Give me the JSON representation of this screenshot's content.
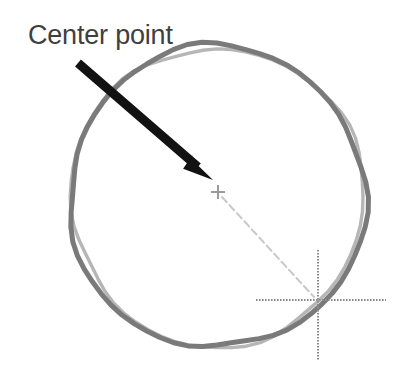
{
  "canvas": {
    "width": 397,
    "height": 381,
    "background_color": "#ffffff"
  },
  "annotation": {
    "label": "Center point",
    "label_color": "#3f3f3f",
    "label_x": 28,
    "label_y": 44,
    "font_size_px": 27
  },
  "shapes": {
    "circle": {
      "name": "hand-drawn-circle",
      "center_x": 217,
      "center_y": 197,
      "radius_x": 148,
      "radius_y": 151,
      "stroke_color": "#7a7a7a",
      "stroke_width": 5
    },
    "arrow": {
      "name": "pointer-arrow",
      "tail_x": 78,
      "tail_y": 63,
      "tip_x": 213,
      "tip_y": 180,
      "color": "#121212",
      "stroke_width": 9
    },
    "center_marker": {
      "name": "center-point-plus",
      "x": 218,
      "y": 192,
      "arm_length": 7,
      "color": "#9a9a9a",
      "stroke_width": 2
    },
    "leader_line": {
      "name": "dotted-leader-line",
      "from_x": 222,
      "from_y": 197,
      "to_x": 314,
      "to_y": 297,
      "color": "#c8c8c8",
      "stroke_width": 2
    },
    "crosshair": {
      "name": "crosshair-marker",
      "center_x": 318,
      "center_y": 300,
      "h_start_x": 256,
      "h_end_x": 386,
      "v_start_y": 250,
      "v_end_y": 361,
      "color": "#8c8c8c",
      "stroke_width": 2
    }
  }
}
